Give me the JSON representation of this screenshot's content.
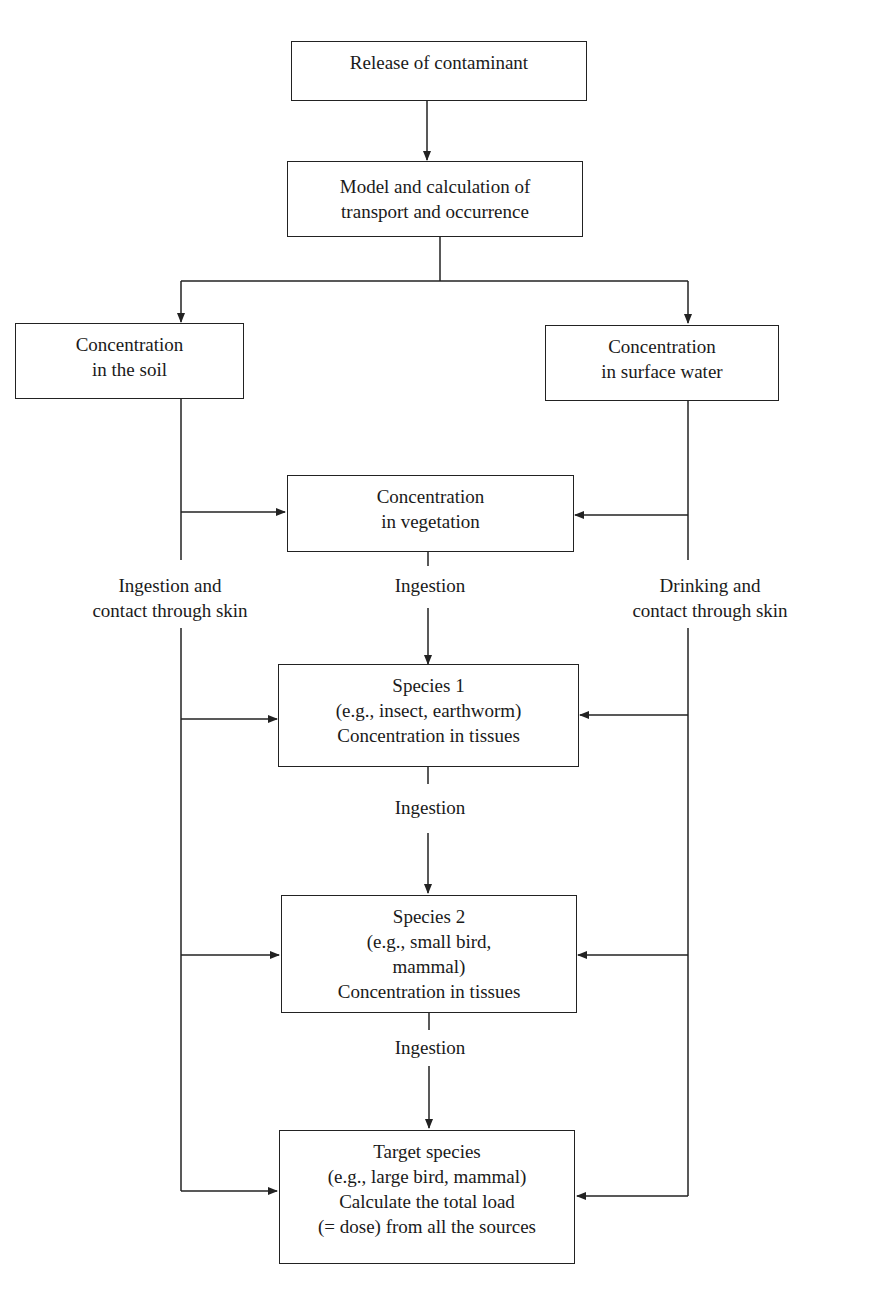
{
  "diagram": {
    "type": "flowchart",
    "nodes": {
      "release": {
        "lines": [
          "Release of contaminant"
        ]
      },
      "model": {
        "lines": [
          "Model and calculation of",
          "transport and occurrence"
        ]
      },
      "soil": {
        "lines": [
          "Concentration",
          "in the soil"
        ]
      },
      "water": {
        "lines": [
          "Concentration",
          "in surface water"
        ]
      },
      "vegetation": {
        "lines": [
          "Concentration",
          "in vegetation"
        ]
      },
      "species1": {
        "lines": [
          "Species 1",
          "(e.g., insect, earthworm)",
          "Concentration in tissues"
        ]
      },
      "species2": {
        "lines": [
          "Species 2",
          "(e.g., small bird,",
          "mammal)",
          "Concentration in tissues"
        ]
      },
      "target": {
        "lines": [
          "Target species",
          "(e.g., large bird, mammal)",
          "Calculate the total load",
          "(= dose) from all the sources"
        ]
      }
    },
    "edge_labels": {
      "soil_path": {
        "lines": [
          "Ingestion and",
          "contact through skin"
        ]
      },
      "water_path": {
        "lines": [
          "Drinking and",
          "contact through skin"
        ]
      },
      "veg_to_species1": {
        "lines": [
          "Ingestion"
        ]
      },
      "species1_to_species2": {
        "lines": [
          "Ingestion"
        ]
      },
      "species2_to_target": {
        "lines": [
          "Ingestion"
        ]
      }
    },
    "edges": [
      {
        "from": "release",
        "to": "model"
      },
      {
        "from": "model",
        "to": "soil"
      },
      {
        "from": "model",
        "to": "water"
      },
      {
        "from": "soil",
        "to": "vegetation"
      },
      {
        "from": "water",
        "to": "vegetation"
      },
      {
        "from": "vegetation",
        "to": "species1",
        "label": "Ingestion"
      },
      {
        "from": "soil",
        "to": "species1",
        "label": "Ingestion and contact through skin"
      },
      {
        "from": "water",
        "to": "species1",
        "label": "Drinking and contact through skin"
      },
      {
        "from": "species1",
        "to": "species2",
        "label": "Ingestion"
      },
      {
        "from": "soil",
        "to": "species2"
      },
      {
        "from": "water",
        "to": "species2"
      },
      {
        "from": "species2",
        "to": "target",
        "label": "Ingestion"
      },
      {
        "from": "soil",
        "to": "target"
      },
      {
        "from": "water",
        "to": "target"
      }
    ],
    "colors": {
      "line": "#222222",
      "background": "#ffffff",
      "text": "#1a1a1a"
    }
  }
}
